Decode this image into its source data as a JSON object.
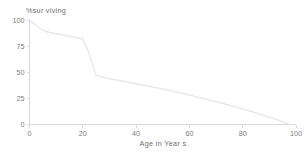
{
  "chart_data": {
    "type": "line",
    "title": "%sur viving",
    "xlabel": "Age in Year s",
    "ylabel": "",
    "xlim": [
      0,
      100
    ],
    "ylim": [
      0,
      100
    ],
    "xticks": [
      0,
      20,
      40,
      60,
      80,
      100
    ],
    "yticks": [
      0,
      25,
      50,
      75,
      100
    ],
    "xtick_labels": [
      "0",
      "20",
      "40",
      "60",
      "80",
      "100"
    ],
    "ytick_labels": [
      "0",
      "25",
      "50",
      "75",
      "100"
    ],
    "grid": false,
    "legend": null,
    "line_color": "#e6e6e6",
    "axis_color": "#d9d9d9",
    "text_color": "#6e6e6e",
    "background": "#ffffff",
    "series": [
      {
        "name": "survival",
        "x": [
          0,
          3,
          6,
          10,
          14,
          18,
          20,
          22,
          25,
          30,
          40,
          50,
          60,
          70,
          80,
          90,
          98
        ],
        "values": [
          100,
          94,
          89,
          87,
          85,
          83,
          82,
          70,
          47,
          44,
          39,
          34,
          28,
          22,
          15,
          7,
          0
        ]
      }
    ]
  },
  "axes": {
    "title_label": "%sur viving",
    "x_axis_label": "Age in Year s"
  }
}
